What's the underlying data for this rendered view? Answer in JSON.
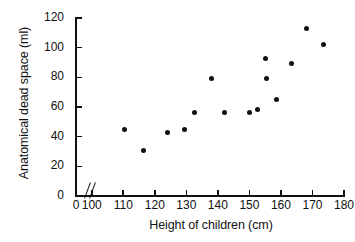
{
  "chart_data": {
    "type": "scatter",
    "title": "",
    "xlabel": "Height of children (cm)",
    "ylabel": "Anatomical dead space (ml)",
    "xlim": [
      95,
      180
    ],
    "ylim": [
      0,
      120
    ],
    "xticks": [
      100,
      110,
      120,
      130,
      140,
      150,
      160,
      170,
      180
    ],
    "yticks": [
      0,
      20,
      40,
      60,
      80,
      100,
      120
    ],
    "x_axis_break": true,
    "x_axis_break_label": "0",
    "grid": false,
    "legend": null,
    "marker": "filled-circle",
    "marker_color": "#111111",
    "points": [
      {
        "x": 110.5,
        "y": 44.5
      },
      {
        "x": 116.5,
        "y": 31.0
      },
      {
        "x": 124.0,
        "y": 42.5
      },
      {
        "x": 129.5,
        "y": 44.5
      },
      {
        "x": 132.5,
        "y": 56.5
      },
      {
        "x": 138.0,
        "y": 79.0
      },
      {
        "x": 142.0,
        "y": 56.5
      },
      {
        "x": 150.0,
        "y": 56.5
      },
      {
        "x": 152.5,
        "y": 58.0
      },
      {
        "x": 155.0,
        "y": 92.5
      },
      {
        "x": 155.5,
        "y": 79.0
      },
      {
        "x": 158.5,
        "y": 65.0
      },
      {
        "x": 163.5,
        "y": 89.5
      },
      {
        "x": 168.0,
        "y": 113.0
      },
      {
        "x": 173.5,
        "y": 102.0
      }
    ]
  }
}
